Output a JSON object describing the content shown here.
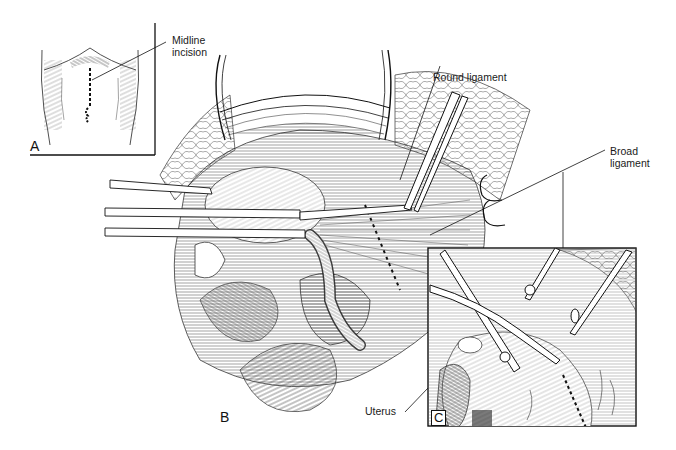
{
  "figure": {
    "type": "surgical-illustration",
    "panels": [
      {
        "id": "A",
        "label": "A",
        "description": "Abdomen outline with dashed midline incision"
      },
      {
        "id": "B",
        "label": "B",
        "description": "Opened abdomen with clamps on round ligament and broad ligament, bowel below"
      },
      {
        "id": "C",
        "label": "C",
        "description": "Inset: clamps and scissors opening broad ligament beside uterus"
      }
    ],
    "labels": {
      "midline_incision": "Midline\nincision",
      "round_ligament": "Round ligament",
      "broad_ligament": "Broad\nligament",
      "uterus": "Uterus"
    },
    "colors": {
      "ink": "#111111",
      "background": "#ffffff",
      "hatch": "#444444"
    }
  }
}
